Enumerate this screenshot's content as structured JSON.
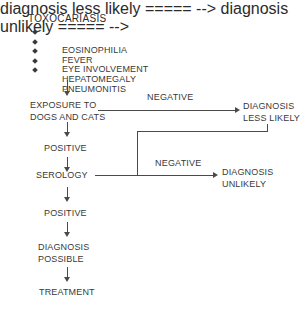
{
  "diagram": {
    "title": "TOXOCARIASIS",
    "symptoms": [
      {
        "label": "EOSINOPHILIA",
        "bullet": "diamond-bullet-icon"
      },
      {
        "label": "FEVER",
        "bullet": "diamond-bullet-icon"
      },
      {
        "label": "EYE INVOLVEMENT",
        "bullet": "diamond-bullet-icon"
      },
      {
        "label": "HEPATOMEGALY",
        "bullet": "diamond-bullet-icon"
      },
      {
        "label": "PNEUMONITIS",
        "bullet": "diamond-bullet-icon"
      }
    ],
    "nodes": {
      "exposure": "EXPOSURE TO\nDOGS AND CATS",
      "positive_exposure": "POSITIVE",
      "serology": "SEROLOGY",
      "positive_serology": "POSITIVE",
      "diagnosis_possible": "DIAGNOSIS\nPOSSIBLE",
      "treatment": "TREATMENT",
      "diagnosis_less_likely": "DIAGNOSIS\nLESS LIKELY",
      "diagnosis_unlikely": "DIAGNOSIS\nUNLIKELY"
    },
    "edge_labels": {
      "negative_exposure": "NEGATIVE",
      "negative_serology": "NEGATIVE"
    },
    "colors": {
      "background": "#ffffff",
      "text": "#3a3a3a",
      "title_text": "#2b2b2b",
      "connector": "#4a4a4a"
    }
  }
}
